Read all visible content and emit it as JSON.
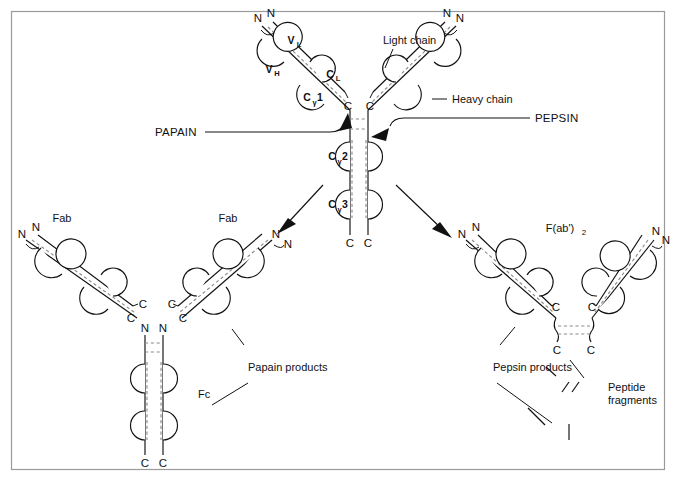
{
  "figure": {
    "frame_color": "#9a9a9a",
    "line_color": "#111111",
    "disulfide_color": "#8c8c8c",
    "background": "#ffffff"
  },
  "intact_antibody": {
    "name": "intact-igg",
    "domain_labels": [
      {
        "id": "vl",
        "base": "V",
        "sub": "L"
      },
      {
        "id": "vh",
        "base": "V",
        "sub": "H"
      },
      {
        "id": "cl",
        "base": "C",
        "sub": "L"
      },
      {
        "id": "cg1",
        "base": "C",
        "sub": "γ",
        "num": "1"
      },
      {
        "id": "cg2",
        "base": "C",
        "sub": "γ",
        "num": "2"
      },
      {
        "id": "cg3",
        "base": "C",
        "sub": "γ",
        "num": "3"
      }
    ],
    "terminus_n": "N",
    "terminus_c": "C",
    "annotations": [
      {
        "id": "light-chain",
        "text": "Light chain"
      },
      {
        "id": "heavy-chain",
        "text": "Heavy chain"
      }
    ]
  },
  "enzymes": [
    {
      "id": "papain",
      "label": "PAPAIN",
      "side": "left"
    },
    {
      "id": "pepsin",
      "label": "PEPSIN",
      "side": "right"
    }
  ],
  "products": {
    "papain": {
      "group_label": "Papain products",
      "fragments": [
        {
          "id": "fab-left",
          "label": "Fab"
        },
        {
          "id": "fab-middle",
          "label": "Fab"
        },
        {
          "id": "fc",
          "label": "Fc"
        }
      ]
    },
    "pepsin": {
      "group_label": "Pepsin products",
      "fragments": [
        {
          "id": "fab2",
          "label": "F(ab')",
          "sub": "2"
        },
        {
          "id": "peptides",
          "label_line1": "Peptide",
          "label_line2": "fragments"
        }
      ]
    }
  },
  "termini": {
    "n": "N",
    "c": "C"
  }
}
